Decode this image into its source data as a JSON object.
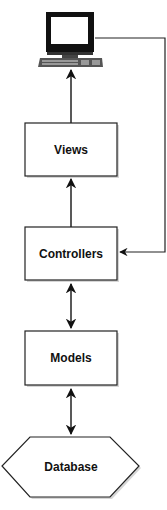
{
  "diagram": {
    "type": "MVC architecture flow",
    "nodes": [
      {
        "id": "computer",
        "label": "",
        "icon": "computer-icon"
      },
      {
        "id": "views",
        "label": "Views"
      },
      {
        "id": "controllers",
        "label": "Controllers"
      },
      {
        "id": "models",
        "label": "Models"
      },
      {
        "id": "database",
        "label": "Database",
        "shape": "hexagon"
      }
    ],
    "edges": [
      {
        "from": "views",
        "to": "computer",
        "direction": "one-way"
      },
      {
        "from": "controllers",
        "to": "views",
        "direction": "one-way"
      },
      {
        "from": "computer",
        "to": "controllers",
        "direction": "one-way",
        "route": "right-side feedback loop"
      },
      {
        "from": "controllers",
        "to": "models",
        "direction": "two-way"
      },
      {
        "from": "models",
        "to": "database",
        "direction": "two-way"
      }
    ],
    "colors": {
      "stroke": "#222222",
      "fill": "#ffffff",
      "shadow": "#cfcfcf"
    }
  }
}
